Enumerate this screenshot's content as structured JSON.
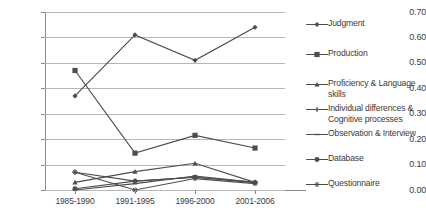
{
  "chart_data": {
    "type": "line",
    "title": "",
    "subtitle": "",
    "xlabel": "",
    "ylabel": "",
    "categories": [
      "1985-1990",
      "1991-1995",
      "1996-2000",
      "2001-2006"
    ],
    "ylim": [
      0.0,
      0.7
    ],
    "ytick_labels": [
      "0.00",
      "0.10",
      "0.20",
      "0.30",
      "0.40",
      "0.50",
      "0.60",
      "0.70"
    ],
    "ytick_values": [
      0.0,
      0.1,
      0.2,
      0.3,
      0.4,
      0.5,
      0.6,
      0.7
    ],
    "grid": true,
    "legend_position": "right",
    "series": [
      {
        "name": "Judgment",
        "marker": "diamond",
        "values": [
          0.37,
          0.61,
          0.51,
          0.64
        ]
      },
      {
        "name": "Production",
        "marker": "square",
        "values": [
          0.47,
          0.145,
          0.215,
          0.165
        ]
      },
      {
        "name": "Proficiency & Language skills",
        "marker": "triangle",
        "values": [
          0.03,
          0.072,
          0.105,
          0.03
        ]
      },
      {
        "name": "Individual differences &\nCognitive processes",
        "marker": "plus",
        "values": [
          0.07,
          0.035,
          0.05,
          0.03
        ]
      },
      {
        "name": "Observation & Interview",
        "marker": "dash",
        "values": [
          0.0,
          0.025,
          0.055,
          0.03
        ]
      },
      {
        "name": "Database",
        "marker": "circle",
        "values": [
          0.005,
          0.035,
          0.05,
          0.03
        ]
      },
      {
        "name": "Questionnaire",
        "marker": "star",
        "values": [
          0.07,
          0.0,
          0.045,
          0.025
        ]
      }
    ],
    "colors": {
      "line": "#4d4d4d",
      "grid": "#b6b6b6",
      "axis": "#8a8a8a",
      "text": "#3a3a3a"
    }
  },
  "legend": {
    "items": [
      {
        "label": "Judgment"
      },
      {
        "label": "Production"
      },
      {
        "label": "Proficiency & Language skills"
      },
      {
        "label": "Individual differences &\nCognitive processes"
      },
      {
        "label": "Observation & Interview"
      },
      {
        "label": "Database"
      },
      {
        "label": "Questionnaire"
      }
    ]
  }
}
